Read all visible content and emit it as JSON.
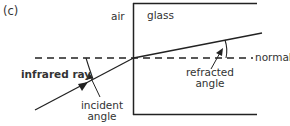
{
  "figure_label": "(c)",
  "labels": {
    "air": "air",
    "glass": "glass",
    "normal": "normal",
    "infrared_ray": "infrared ray",
    "incident_angle_line1": "incident",
    "incident_angle_line2": "angle",
    "refracted_angle_line1": "refracted",
    "refracted_angle_line2": "angle"
  },
  "colors": {
    "line": "#222222",
    "text": "#333333"
  }
}
